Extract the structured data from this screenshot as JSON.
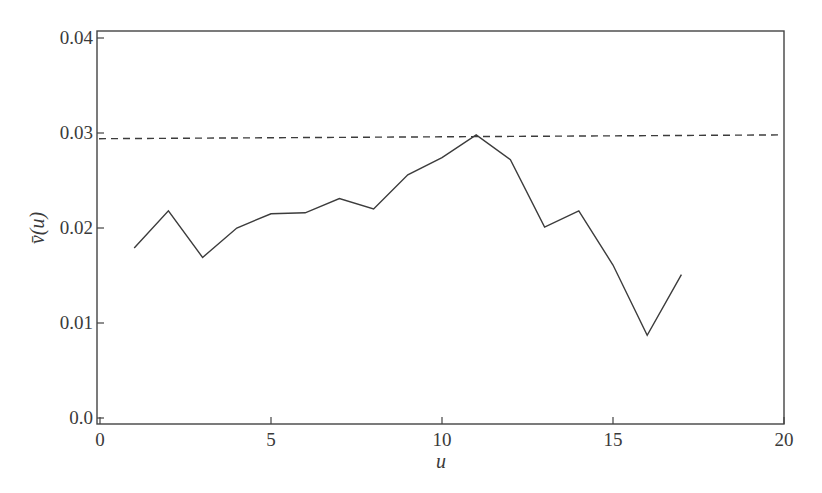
{
  "chart_data": {
    "type": "line",
    "title": "",
    "xlabel": "u",
    "ylabel": "v̄(u)",
    "xlim": [
      0,
      20
    ],
    "ylim": [
      0.0,
      0.04
    ],
    "xticks": [
      0,
      5,
      10,
      15,
      20
    ],
    "xtick_labels": [
      "0",
      "5",
      "10",
      "15",
      "20"
    ],
    "yticks": [
      0.0,
      0.01,
      0.02,
      0.03,
      0.04
    ],
    "ytick_labels": [
      "0.0",
      "0.01",
      "0.02",
      "0.03",
      "0.04"
    ],
    "grid": false,
    "legend": null,
    "series": [
      {
        "name": "v̄(u)",
        "style": "solid",
        "x": [
          1,
          2,
          3,
          4,
          5,
          6,
          7,
          8,
          9,
          10,
          11,
          12,
          13,
          14,
          15,
          16,
          17
        ],
        "values": [
          0.0179,
          0.0218,
          0.0169,
          0.02,
          0.0215,
          0.0216,
          0.0231,
          0.022,
          0.0256,
          0.0274,
          0.0298,
          0.0272,
          0.0201,
          0.0218,
          0.0161,
          0.0087,
          0.0151
        ]
      },
      {
        "name": "reference level",
        "style": "dashed",
        "x": [
          0,
          20
        ],
        "values": [
          0.0294,
          0.0298
        ]
      }
    ]
  },
  "colors": {
    "line": "#3c3c3c",
    "axis": "#444444",
    "background": "#ffffff"
  }
}
